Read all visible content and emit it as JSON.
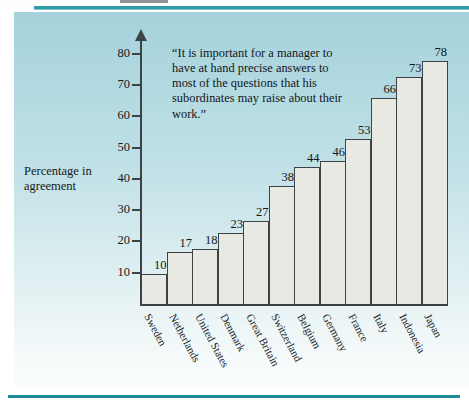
{
  "figure": {
    "quote": "“It is important for a manager to have at hand precise answers to most of the questions that his subordinates may raise about their work.”",
    "accent_color": "#2f9aa8",
    "bar_fill_color": "#e9e9e4",
    "bar_edge_color": "#3b4346",
    "background_top_color": "#a5d2dc",
    "background_bottom_color": "#fbfdfd"
  },
  "chart_data": {
    "type": "bar",
    "title": "",
    "xlabel": "",
    "ylabel": "Percentage in agreement",
    "ylim": [
      0,
      85
    ],
    "yticks": [
      10,
      20,
      30,
      40,
      50,
      60,
      70,
      80
    ],
    "grid": false,
    "legend": null,
    "categories": [
      "Sweden",
      "Netherlands",
      "United States",
      "Denmark",
      "Great Britain",
      "Switzerland",
      "Belgium",
      "Germany",
      "France",
      "Italy",
      "Indonesia",
      "Japan"
    ],
    "values": [
      10,
      17,
      18,
      23,
      27,
      38,
      44,
      46,
      53,
      66,
      73,
      78
    ],
    "annotations": [
      "“It is important for a manager to have at hand precise answers to most of the questions that his subordinates may raise about their work.”"
    ]
  }
}
